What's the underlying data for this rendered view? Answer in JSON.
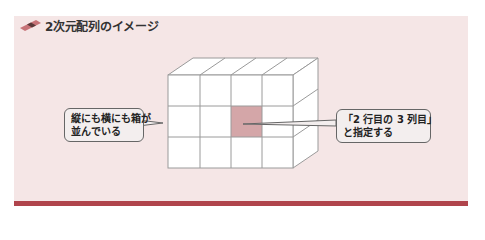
{
  "figure": {
    "title": "2次元配列のイメージ",
    "title_icon": "eraser-tab-icon",
    "colors": {
      "panel_bg": "#f5e6e6",
      "accent_bar": "#b0444c",
      "highlight_cell": "#d4a6a8",
      "grid_line": "#9a9a9a"
    }
  },
  "grid": {
    "rows": 3,
    "columns": 4,
    "highlighted_cell": {
      "row": 2,
      "column": 3
    }
  },
  "callouts": {
    "left": {
      "line1": "縦にも横にも箱が",
      "line2": "並んでいる"
    },
    "right": {
      "line1": "「2 行目の 3 列目」",
      "line2": "と指定する"
    }
  }
}
